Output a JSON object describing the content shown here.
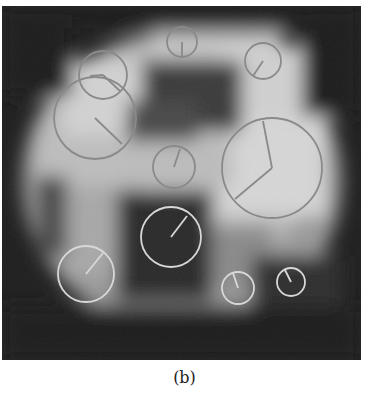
{
  "figure": {
    "caption": "(b)",
    "image_size": [
      359,
      354
    ],
    "keypoints": [
      {
        "cx": 180,
        "cy": 36,
        "r": 15,
        "ox": 180,
        "oy": 50,
        "style": "dark"
      },
      {
        "cx": 261,
        "cy": 55,
        "r": 18,
        "ox": 251,
        "oy": 70,
        "style": "dark"
      },
      {
        "cx": 101,
        "cy": 69,
        "r": 24,
        "ox": 118,
        "oy": 85,
        "ox2": 88,
        "oy2": 70,
        "style": "dark"
      },
      {
        "cx": 93,
        "cy": 112,
        "r": 41,
        "ox": 120,
        "oy": 138,
        "style": "dark"
      },
      {
        "cx": 172,
        "cy": 161,
        "r": 21,
        "ox": 178,
        "oy": 143,
        "style": "dark"
      },
      {
        "cx": 270,
        "cy": 162,
        "r": 50,
        "ox": 261,
        "oy": 115,
        "ox2": 233,
        "oy2": 193,
        "style": "dark"
      },
      {
        "cx": 169,
        "cy": 231,
        "r": 30,
        "ox": 185,
        "oy": 210,
        "style": "light"
      },
      {
        "cx": 84,
        "cy": 268,
        "r": 28,
        "ox": 101,
        "oy": 247,
        "style": "light"
      },
      {
        "cx": 236,
        "cy": 282,
        "r": 16,
        "ox": 231,
        "oy": 267,
        "style": "light"
      },
      {
        "cx": 289,
        "cy": 276,
        "r": 14,
        "ox": 283,
        "oy": 264,
        "style": "light"
      }
    ]
  },
  "colors": {
    "circle_dark": "#8a8a8a",
    "circle_light": "#d8d8d8"
  }
}
